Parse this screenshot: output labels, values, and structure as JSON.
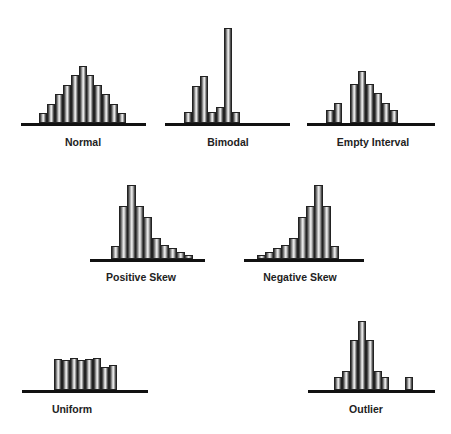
{
  "chart_data": [
    {
      "type": "bar",
      "title": "Normal",
      "values": [
        1,
        2,
        3,
        4,
        5,
        6,
        5,
        4,
        3,
        2,
        1
      ],
      "unit_px": 9.5
    },
    {
      "type": "bar",
      "title": "Bimodal",
      "values": [
        1,
        3.5,
        4.5,
        1,
        1.5,
        9,
        1
      ],
      "unit_px": 10.5
    },
    {
      "type": "bar",
      "title": "Empty Interval",
      "values": [
        1,
        1.5,
        0,
        3,
        4,
        3,
        2.3,
        1.5,
        1
      ],
      "unit_px": 13
    },
    {
      "type": "bar",
      "title": "Positive Skew",
      "values": [
        1.2,
        5,
        7,
        5,
        4,
        2,
        1.3,
        1,
        0.7,
        0.4
      ],
      "unit_px": 10.5
    },
    {
      "type": "bar",
      "title": "Negative Skew",
      "values": [
        0.4,
        0.7,
        1,
        1.3,
        2,
        4,
        5,
        7,
        5,
        1.2
      ],
      "unit_px": 10.5
    },
    {
      "type": "bar",
      "title": "Uniform",
      "values": [
        31,
        30,
        32,
        30,
        31,
        32,
        23,
        25
      ],
      "unit_px": 1
    },
    {
      "type": "bar",
      "title": "Outlier",
      "values": [
        1,
        1.5,
        4,
        5.5,
        4,
        1.5,
        1,
        0,
        0,
        1
      ],
      "unit_px": 12.5
    }
  ],
  "panels": [
    {
      "label": "Normal"
    },
    {
      "label": "Bimodal"
    },
    {
      "label": "Empty Interval"
    },
    {
      "label": "Positive Skew"
    },
    {
      "label": "Negative Skew"
    },
    {
      "label": "Uniform"
    },
    {
      "label": "Outlier"
    }
  ]
}
